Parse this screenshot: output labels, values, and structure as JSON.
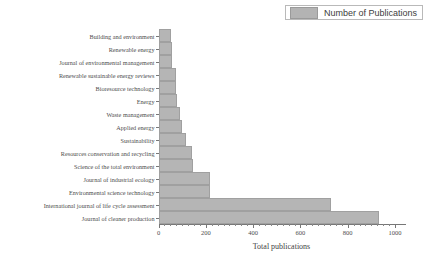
{
  "legend": {
    "label": "Number of Publications",
    "swatch_color": "#b5b5b5",
    "position": "top-right"
  },
  "axis": {
    "x_title": "Total publications",
    "x_ticks": [
      "0",
      "200",
      "400",
      "600",
      "800",
      "1000"
    ],
    "x_min": 0,
    "x_max": 1040
  },
  "chart_data": {
    "type": "bar",
    "orientation": "horizontal",
    "title": "",
    "xlabel": "Total publications",
    "ylabel": "",
    "xlim": [
      0,
      1040
    ],
    "grid": false,
    "legend": "Number of Publications",
    "series_color": "#b5b5b5",
    "categories": [
      "Building and environment",
      "Renewable energy",
      "Journal of environmental management",
      "Renewable sustainable energy reviews",
      "Bioresource technology",
      "Energy",
      "Waste management",
      "Applied energy",
      "Sustainability",
      "Resources conservation and recycling",
      "Science of the total environment",
      "Journal of industrial ecology",
      "Environmental science technology",
      "International journal of life cycle assessment",
      "Journal of cleaner production"
    ],
    "values": [
      53,
      56,
      59,
      73,
      76,
      79,
      89,
      99,
      117,
      141,
      145,
      216,
      218,
      730,
      933
    ],
    "series": [
      {
        "name": "Number of Publications",
        "values": [
          53,
          56,
          59,
          73,
          76,
          79,
          89,
          99,
          117,
          141,
          145,
          216,
          218,
          730,
          933
        ]
      }
    ]
  }
}
